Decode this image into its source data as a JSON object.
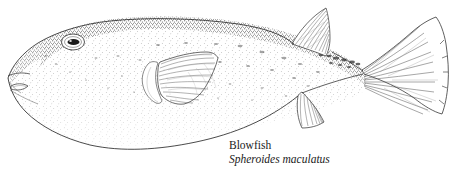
{
  "illustration": {
    "subject": "blowfish-lateral-view",
    "style": "stipple-pen-and-ink-scientific-illustration",
    "background_color": "#ffffff",
    "ink_color": "#1a1a1a",
    "stipple_color": "#3a3a3a",
    "outline_color": "#2b2b2b",
    "parts": [
      "body-outline",
      "dorsal-stipple-band",
      "eye",
      "pupil",
      "mouth-beak",
      "gill-slit",
      "pectoral-fin",
      "dorsal-fin",
      "anal-fin",
      "caudal-fin",
      "caudal-peduncle"
    ]
  },
  "caption": {
    "common_name": "Blowfish",
    "scientific_name": "Spheroides maculatus"
  }
}
